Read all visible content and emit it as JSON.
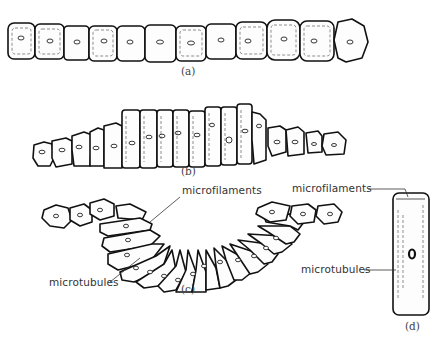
{
  "figure": {
    "panels": [
      {
        "id": "a",
        "label": "(a)",
        "description": "flat row of cuboidal epithelial cells",
        "cell_count": 12
      },
      {
        "id": "b",
        "label": "(b)",
        "description": "central cells elongate into columnar shape",
        "cell_count": 17
      },
      {
        "id": "c",
        "label": "(c)",
        "description": "sheet bends as apical ends constrict (invagination)",
        "cell_count": 21
      },
      {
        "id": "d",
        "label": "(d)",
        "description": "single elongated cell showing cytoskeleton",
        "cell_count": 1
      }
    ],
    "annotations": {
      "c_microfilaments": "microfilaments",
      "c_microtubules": "microtubules",
      "d_microfilaments": "microfilaments",
      "d_microtubules": "microtubules"
    }
  },
  "colors": {
    "background": "#ffffff",
    "ink": "#111111",
    "label_text": "#333333"
  }
}
